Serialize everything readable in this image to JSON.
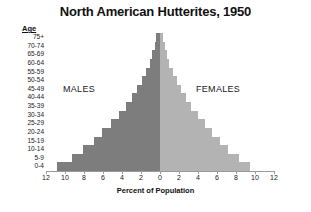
{
  "chart_data": {
    "type": "bar",
    "subtype": "population-pyramid",
    "title": "North American Hutterites, 1950",
    "xlabel": "Percent of Population",
    "ylabel": "Age",
    "xlim": [
      -12,
      12
    ],
    "xticks": [
      12,
      10,
      8,
      6,
      4,
      2,
      0,
      2,
      4,
      6,
      8,
      10,
      12
    ],
    "grid": false,
    "legend_position": "inside-plot",
    "categories": [
      "75+",
      "70-74",
      "65-69",
      "60-64",
      "55-59",
      "50-54",
      "45-49",
      "40-44",
      "35-39",
      "30-34",
      "25-29",
      "20-24",
      "15-19",
      "10-14",
      "5-9",
      "0-4"
    ],
    "series": [
      {
        "name": "MALES",
        "side": "left",
        "color": "#7d7d7d",
        "values": [
          0.4,
          0.5,
          0.8,
          1.1,
          1.5,
          1.9,
          2.4,
          3.0,
          3.6,
          4.3,
          5.2,
          6.1,
          7.0,
          8.1,
          9.3,
          10.8
        ]
      },
      {
        "name": "FEMALES",
        "side": "right",
        "color": "#b3b3b3",
        "values": [
          0.3,
          0.5,
          0.7,
          1.0,
          1.4,
          1.8,
          2.2,
          2.7,
          3.3,
          4.0,
          4.7,
          5.5,
          6.3,
          7.2,
          8.3,
          9.5
        ]
      }
    ]
  }
}
